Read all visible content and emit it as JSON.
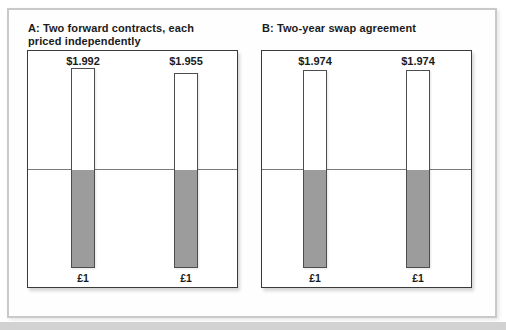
{
  "chart_data": [
    {
      "type": "bar",
      "panel_label": "A",
      "title": "A: Two forward contracts, each priced independently",
      "bars": [
        {
          "top_label": "$1.992",
          "top_value": 1.992,
          "bottom_label": "£1",
          "bottom_value": 1
        },
        {
          "top_label": "$1.955",
          "top_value": 1.955,
          "bottom_label": "£1",
          "bottom_value": 1
        }
      ],
      "layout": "white bars above midline represent dollars received, gray bars below midline represent pounds paid"
    },
    {
      "type": "bar",
      "panel_label": "B",
      "title": "B: Two-year swap agreement",
      "bars": [
        {
          "top_label": "$1.974",
          "top_value": 1.974,
          "bottom_label": "£1",
          "bottom_value": 1
        },
        {
          "top_label": "$1.974",
          "top_value": 1.974,
          "bottom_label": "£1",
          "bottom_value": 1
        }
      ],
      "layout": "white bars above midline represent dollars received, gray bars below midline represent pounds paid"
    }
  ],
  "style": {
    "gray_bar_fill": "#9c9c9c",
    "panel_border": "#3a3a3a",
    "frame_border": "#c9c9c9",
    "midline_color": "#7a7a7a",
    "bottom_strip": "#d2d2d2",
    "background": "#ffffff"
  }
}
